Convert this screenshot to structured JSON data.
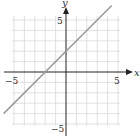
{
  "chart_data": {
    "type": "line",
    "title": "",
    "xlabel": "x",
    "ylabel": "y",
    "xlim": [
      -5,
      5
    ],
    "ylim": [
      -5,
      5
    ],
    "grid": true,
    "x_ticks_labeled": [
      -5,
      5
    ],
    "y_ticks_labeled": [
      5,
      -5
    ],
    "tick_labels": {
      "x_neg": "−5",
      "x_pos": "5",
      "y_pos": "5",
      "y_neg": "−5"
    },
    "series": [
      {
        "name": "y = x + 2",
        "equation": "y = x + 2",
        "slope": 1,
        "intercept": 2,
        "x": [
          -6,
          4.4
        ],
        "y": [
          -4,
          6.4
        ]
      }
    ],
    "colors": {
      "line": "#9a9a9a",
      "axis": "#222222",
      "grid": "#d9d9d9"
    }
  }
}
